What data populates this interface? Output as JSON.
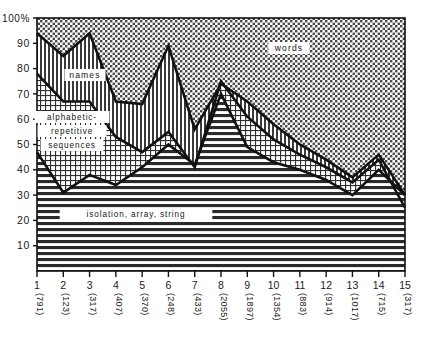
{
  "chart_data": {
    "type": "area",
    "title": "",
    "subtitle": "",
    "xlabel": "",
    "ylabel": "",
    "ylim": [
      0,
      100
    ],
    "xlim": [
      1,
      15
    ],
    "grid": false,
    "legend_position": "inline-annotations",
    "stacked": true,
    "categories": [
      "1",
      "2",
      "3",
      "4",
      "5",
      "6",
      "7",
      "8",
      "9",
      "10",
      "11",
      "12",
      "13",
      "14",
      "15"
    ],
    "category_counts": [
      "(791)",
      "(123)",
      "(317)",
      "(407)",
      "(370)",
      "(248)",
      "(433)",
      "(2055)",
      "(1897)",
      "(1354)",
      "(883)",
      "(914)",
      "(1017)",
      "(715)",
      "(317)"
    ],
    "y_ticks": [
      "10",
      "20",
      "30",
      "40",
      "50",
      "60",
      "70",
      "80",
      "90",
      "100%"
    ],
    "y_tick_values": [
      10,
      20,
      30,
      40,
      50,
      60,
      70,
      80,
      90,
      100
    ],
    "boundaries": {
      "top_of_isolation_array_string": [
        47,
        31,
        38,
        34,
        41,
        50,
        42,
        70,
        49,
        43,
        40,
        36,
        30,
        40,
        30
      ],
      "top_of_alphabetic_repetitive": [
        78,
        67,
        67,
        53,
        47,
        55,
        41,
        75,
        61,
        52,
        46,
        41,
        35,
        44,
        25
      ],
      "top_of_names": [
        94,
        85,
        94,
        67,
        66,
        89,
        56,
        74,
        67,
        58,
        50,
        44,
        37,
        46,
        30
      ]
    },
    "series": [
      {
        "name": "isolation, array, string",
        "label": "isolation, array, string",
        "fill_pattern": "horizontal-lines",
        "values": [
          47,
          31,
          38,
          34,
          41,
          50,
          42,
          70,
          49,
          43,
          40,
          36,
          30,
          40,
          30
        ]
      },
      {
        "name": "alphabetic-repetitive sequences",
        "label_line1": "alphabetic-",
        "label_line2": "repetitive",
        "label_line3": "sequences",
        "fill_pattern": "grid-crosshatch",
        "values": [
          31,
          36,
          29,
          19,
          6,
          5,
          -1,
          5,
          12,
          9,
          6,
          5,
          5,
          4,
          -5
        ]
      },
      {
        "name": "names",
        "label": "names",
        "fill_pattern": "vertical-lines",
        "values": [
          16,
          18,
          27,
          14,
          19,
          34,
          15,
          -1,
          6,
          6,
          4,
          3,
          2,
          2,
          5
        ]
      },
      {
        "name": "words",
        "label": "words",
        "fill_pattern": "coarse-dots",
        "values": [
          6,
          15,
          6,
          33,
          34,
          11,
          44,
          26,
          33,
          42,
          50,
          56,
          63,
          54,
          70
        ]
      }
    ]
  },
  "annotations": {
    "words_label": "words",
    "names_label": "names",
    "alpha_line1": "alphabetic-",
    "alpha_line2": "repetitive",
    "alpha_line3": "sequences",
    "isolation_label": "isolation, array, string"
  },
  "colors": {
    "stroke": "#111111",
    "background": "#ffffff",
    "text": "#1a1a1a"
  }
}
